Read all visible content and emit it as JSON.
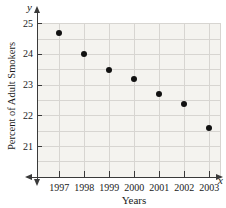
{
  "chart_data": {
    "type": "scatter",
    "title": "",
    "xlabel": "Years",
    "ylabel": "Percent of Adult Smokers",
    "x_axis_symbol": "x",
    "y_axis_symbol": "y",
    "categories": [
      1997,
      1998,
      1999,
      2000,
      2001,
      2002,
      2003
    ],
    "values": [
      24.7,
      24.0,
      23.5,
      23.2,
      22.7,
      22.4,
      21.6
    ],
    "y_ticks": [
      25,
      24,
      23,
      22,
      21
    ],
    "ylim": [
      20,
      25.5
    ],
    "grid_step_y": 0.5,
    "grid": true,
    "legend": "none",
    "point_color": "#111111",
    "grid_color": "#d7d5d1",
    "plot_bg": "#f4f3ef",
    "axis_color": "#3a3a3a"
  }
}
